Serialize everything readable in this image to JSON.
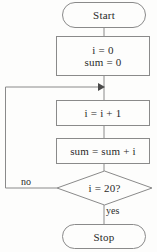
{
  "diagram": {
    "type": "flowchart",
    "stroke_color": "#8a8a8a",
    "text_color": "#2a2a2a",
    "background_color": "#fdfdfc",
    "nodes": [
      {
        "id": "start",
        "shape": "terminator",
        "label": "Start"
      },
      {
        "id": "init",
        "shape": "process",
        "line1": "i = 0",
        "line2": "sum = 0"
      },
      {
        "id": "incr",
        "shape": "process",
        "label": "i = i + 1"
      },
      {
        "id": "accum",
        "shape": "process",
        "label": "sum = sum + i"
      },
      {
        "id": "decide",
        "shape": "decision",
        "label": "i = 20?"
      },
      {
        "id": "stop",
        "shape": "terminator",
        "label": "Stop"
      }
    ],
    "edges": [
      {
        "from": "start",
        "to": "init",
        "label": ""
      },
      {
        "from": "init",
        "to": "incr",
        "label": ""
      },
      {
        "from": "incr",
        "to": "accum",
        "label": ""
      },
      {
        "from": "accum",
        "to": "decide",
        "label": ""
      },
      {
        "from": "decide",
        "to": "incr",
        "label": "no"
      },
      {
        "from": "decide",
        "to": "stop",
        "label": "yes"
      }
    ],
    "labels": {
      "no": "no",
      "yes": "yes"
    }
  }
}
